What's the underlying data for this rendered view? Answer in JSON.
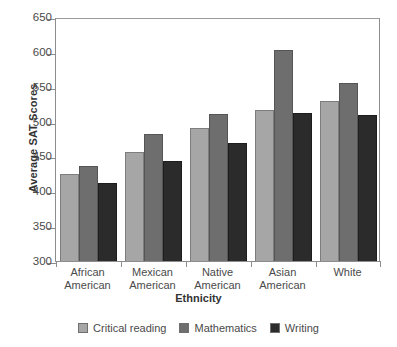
{
  "chart_data": {
    "type": "bar",
    "title": "",
    "xlabel": "Ethnicity",
    "ylabel": "Average SAT Scores",
    "categories": [
      "African American",
      "Mexican American",
      "Native American",
      "Asian American",
      "White"
    ],
    "category_lines": [
      [
        "African",
        "American"
      ],
      [
        "Mexican",
        "American"
      ],
      [
        "Native",
        "American"
      ],
      [
        "Asian",
        "American"
      ],
      [
        "White"
      ]
    ],
    "series": [
      {
        "name": "Critical reading",
        "color": "#a6a6a6",
        "values": [
          425,
          457,
          491,
          517,
          530
        ]
      },
      {
        "name": "Mathematics",
        "color": "#6e6e6e",
        "values": [
          437,
          482,
          511,
          602,
          555
        ]
      },
      {
        "name": "Writing",
        "color": "#2b2b2b",
        "values": [
          412,
          443,
          469,
          513,
          510
        ]
      }
    ],
    "ylim": [
      300,
      650
    ],
    "ytick_step": 50,
    "yticks": [
      300,
      350,
      400,
      450,
      500,
      550,
      600,
      650
    ],
    "grid": false,
    "legend_position": "bottom-center"
  }
}
